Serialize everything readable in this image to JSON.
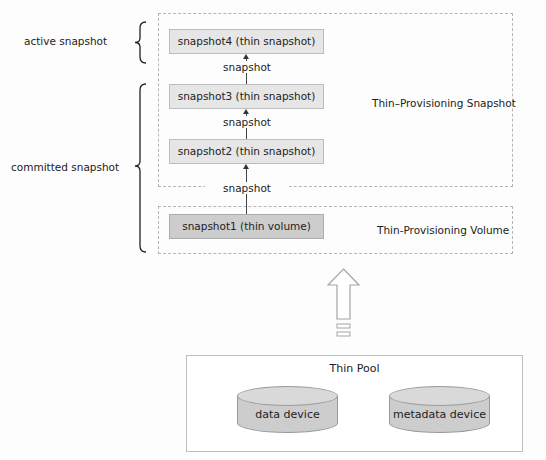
{
  "brackets": {
    "active": {
      "label": "active snapshot"
    },
    "committed": {
      "label": "committed snapshot"
    }
  },
  "regions": {
    "snapshot_region": {
      "label": "Thin–Provisioning Snapshot"
    },
    "volume_region": {
      "label": "Thin-Provisioning Volume"
    }
  },
  "nodes": [
    {
      "id": "snapshot4",
      "label": "snapshot4 (thin snapshot)",
      "kind": "thin snapshot"
    },
    {
      "id": "snapshot3",
      "label": "snapshot3 (thin snapshot)",
      "kind": "thin snapshot"
    },
    {
      "id": "snapshot2",
      "label": "snapshot2 (thin snapshot)",
      "kind": "thin snapshot"
    },
    {
      "id": "snapshot1",
      "label": "snapshot1 (thin volume)",
      "kind": "thin volume"
    }
  ],
  "edges": [
    {
      "from": "snapshot3",
      "to": "snapshot4",
      "label": "snapshot"
    },
    {
      "from": "snapshot2",
      "to": "snapshot3",
      "label": "snapshot"
    },
    {
      "from": "snapshot1",
      "to": "snapshot2",
      "label": "snapshot"
    }
  ],
  "pool": {
    "title": "Thin Pool",
    "devices": [
      {
        "label": "data device"
      },
      {
        "label": "metadata device"
      }
    ]
  },
  "colors": {
    "snapshot_fill": "#e6e6e6",
    "volume_fill": "#cdcdcd",
    "cylinder_fill": "#cdcdcd",
    "dashed_border": "#b5b5b5"
  }
}
